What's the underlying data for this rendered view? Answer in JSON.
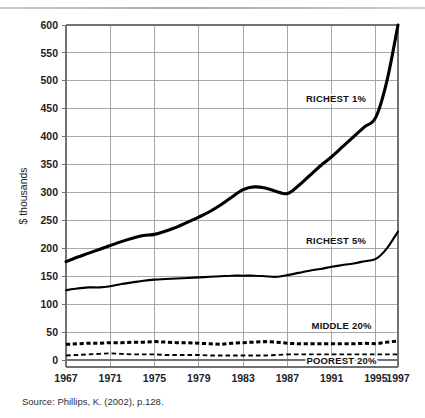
{
  "figure": {
    "source_note": "Source: Phillips, K. (2002), p.128."
  },
  "chart_data": {
    "type": "line",
    "title": "",
    "xlabel": "",
    "ylabel": "$ thousands",
    "xlim": [
      1967,
      1997
    ],
    "ylim": [
      0,
      600
    ],
    "grid": true,
    "legend_position": "inline-labels",
    "x_ticks": [
      1967,
      1971,
      1975,
      1979,
      1983,
      1987,
      1991,
      1995,
      1997
    ],
    "x_tick_labels": [
      "1967",
      "1971",
      "1975",
      "1979",
      "1983",
      "1987",
      "1991",
      "1995",
      "1997"
    ],
    "y_ticks": [
      0,
      50,
      100,
      150,
      200,
      250,
      300,
      350,
      400,
      450,
      500,
      550,
      600
    ],
    "y_tick_labels": [
      "0",
      "50",
      "100",
      "150",
      "200",
      "250",
      "300",
      "350",
      "400",
      "450",
      "500",
      "550",
      "600"
    ],
    "x": [
      1967,
      1968,
      1969,
      1970,
      1971,
      1972,
      1973,
      1974,
      1975,
      1976,
      1977,
      1978,
      1979,
      1980,
      1981,
      1982,
      1983,
      1984,
      1985,
      1986,
      1987,
      1988,
      1989,
      1990,
      1991,
      1992,
      1993,
      1994,
      1995,
      1996,
      1997
    ],
    "series": [
      {
        "name": "RICHEST 1%",
        "label": "RICHEST 1%",
        "style": "solid-thick",
        "values": [
          176,
          184,
          191,
          198,
          205,
          212,
          218,
          223,
          225,
          231,
          238,
          247,
          256,
          266,
          278,
          292,
          305,
          310,
          308,
          302,
          298,
          312,
          330,
          348,
          364,
          382,
          400,
          418,
          435,
          500,
          600
        ]
      },
      {
        "name": "RICHEST 5%",
        "label": "RICHEST 5%",
        "style": "solid-thin",
        "values": [
          125,
          128,
          130,
          130,
          132,
          136,
          139,
          142,
          144,
          145,
          146,
          147,
          148,
          149,
          150,
          151,
          151,
          151,
          150,
          149,
          152,
          156,
          160,
          163,
          167,
          170,
          173,
          177,
          181,
          200,
          230
        ]
      },
      {
        "name": "MIDDLE 20%",
        "label": "MIDDLE 20%",
        "style": "dashed-thick",
        "values": [
          28,
          29,
          30,
          30,
          31,
          31,
          32,
          32,
          33,
          32,
          31,
          31,
          30,
          29,
          28,
          30,
          31,
          32,
          33,
          32,
          30,
          29,
          29,
          29,
          29,
          29,
          29,
          30,
          29,
          32,
          34
        ]
      },
      {
        "name": "POOREST 20%",
        "label": "POOREST 20%",
        "style": "dashed-thin",
        "values": [
          8,
          9,
          10,
          11,
          12,
          11,
          10,
          10,
          10,
          9,
          9,
          9,
          9,
          8,
          8,
          8,
          8,
          8,
          8,
          9,
          10,
          10,
          10,
          10,
          10,
          10,
          10,
          10,
          10,
          10,
          10
        ]
      }
    ],
    "annotations": [
      {
        "text": "RICHEST 1%",
        "x": 1991.4,
        "y": 462
      },
      {
        "text": "RICHEST 5%",
        "x": 1991.4,
        "y": 208
      },
      {
        "text": "MIDDLE 20%",
        "x": 1991.9,
        "y": 55
      },
      {
        "text": "POOREST 20%",
        "x": 1991.9,
        "y": -8
      }
    ]
  }
}
